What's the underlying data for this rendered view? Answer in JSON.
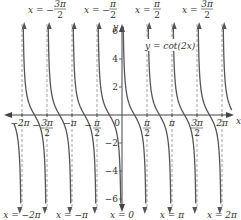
{
  "chart_data": {
    "type": "line",
    "title": "",
    "function_label": "y = cot(2x)",
    "xlabel": "x",
    "ylabel": "y",
    "xlim": [
      -6.6,
      6.8
    ],
    "ylim": [
      -6.8,
      6.8
    ],
    "grid": false,
    "x_tick_labels": [
      "-2π",
      "-3π/2",
      "-π",
      "-π/2",
      "0",
      "π/2",
      "π",
      "3π/2",
      "2π"
    ],
    "x_tick_values": [
      -6.2832,
      -4.7124,
      -3.1416,
      -1.5708,
      0,
      1.5708,
      3.1416,
      4.7124,
      6.2832
    ],
    "y_tick_labels": [
      "-6",
      "-4",
      "-2",
      "2",
      "4",
      "6"
    ],
    "y_tick_values": [
      -6,
      -4,
      -2,
      2,
      4,
      6
    ],
    "asymptotes": [
      -6.2832,
      -4.7124,
      -3.1416,
      -1.5708,
      0,
      1.5708,
      3.1416,
      4.7124,
      6.2832
    ],
    "asymptote_labels_top": [
      "x = −3π/2",
      "x = −π/2",
      "x = π/2",
      "x = 3π/2"
    ],
    "asymptote_labels_bottom": [
      "x = −2π",
      "x = −π",
      "x = 0",
      "x = π",
      "x = 2π"
    ],
    "series": [
      {
        "name": "y = cot(2x)",
        "period": 1.5708,
        "description": "decreasing branches between consecutive asymptotes x = nπ/2"
      }
    ]
  },
  "labels": {
    "top": [
      "x = −",
      "x = −",
      "x = ",
      "x = "
    ],
    "top_num": [
      "3π",
      "π",
      "π",
      "3π"
    ],
    "top_den": [
      "2",
      "2",
      "2",
      "2"
    ],
    "bottom": [
      "x = −2π",
      "x = −π",
      "x = 0",
      "x = π",
      "x = 2π"
    ],
    "function": "y = cot(2x)",
    "axis_x": "x",
    "axis_y": "y"
  }
}
